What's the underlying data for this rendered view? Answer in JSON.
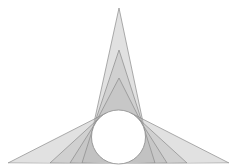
{
  "diagram": {
    "title": "",
    "colors": {
      "background": "#ffffff",
      "fill": "#bdbdbd",
      "stroke": "#8a8a8a",
      "circle_fill": "#ffffff"
    },
    "wedges": {
      "top_count": 3,
      "left_count": 4,
      "right_count": 4
    }
  }
}
